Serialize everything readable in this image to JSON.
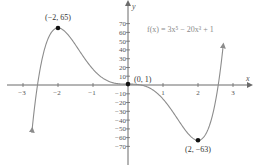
{
  "chart_data": {
    "type": "line",
    "title": "",
    "function_label": "f(x) = 3x⁵ − 20x³ + 1",
    "function_expr": "3x^5 - 20x^3 + 1",
    "xlabel": "x",
    "ylabel": "y",
    "xlim": [
      -3.5,
      3.5
    ],
    "ylim": [
      -80,
      80
    ],
    "x_ticks": [
      -3,
      -2,
      -1,
      1,
      2,
      3
    ],
    "x_tick_labels": [
      "−3",
      "−2",
      "−1",
      "1",
      "2",
      "3"
    ],
    "y_ticks": [
      70,
      60,
      50,
      40,
      30,
      20,
      10,
      -10,
      -20,
      -30,
      -40,
      -50,
      -60,
      -70
    ],
    "y_tick_labels": [
      "70",
      "60",
      "50",
      "40",
      "30",
      "20",
      "10",
      "−10",
      "−20",
      "−30",
      "−40",
      "−50",
      "−60",
      "−70"
    ],
    "grid": false,
    "legend": "none",
    "series": [
      {
        "name": "f(x) = 3x^5 - 20x^3 + 1",
        "x": [
          -2.75,
          -2.5,
          -2.25,
          -2.0,
          -1.75,
          -1.5,
          -1.25,
          -1.0,
          -0.75,
          -0.5,
          -0.25,
          0.0,
          0.25,
          0.5,
          0.75,
          1.0,
          1.25,
          1.5,
          1.75,
          2.0,
          2.25,
          2.5,
          2.75
        ],
        "y": [
          -79.8,
          19.6,
          56.0,
          65.0,
          57.1,
          45.7,
          30.7,
          18.0,
          8.2,
          2.4,
          0.3,
          1.0,
          0.7,
          -0.4,
          -6.2,
          -16.0,
          -28.7,
          -43.7,
          -56.1,
          -63.0,
          -54.0,
          -17.4,
          46.9
        ]
      }
    ],
    "annotations": [
      {
        "label": "(−2, 65)",
        "x": -2,
        "y": 65,
        "type": "local maximum"
      },
      {
        "label": "(0, 1)",
        "x": 0,
        "y": 1,
        "type": "inflection point"
      },
      {
        "label": "(2, −63)",
        "x": 2,
        "y": -63,
        "type": "local minimum"
      }
    ]
  },
  "labels": {
    "x_axis": "x",
    "y_axis": "y",
    "formula": "f(x) = 3x⁵ − 20x³ + 1",
    "max_point": "(−2, 65)",
    "origin_point": "(0, 1)",
    "min_point": "(2, −63)",
    "x_ticks": [
      "−3",
      "−2",
      "−1",
      "1",
      "2",
      "3"
    ],
    "y_ticks_pos": [
      "70",
      "60",
      "50",
      "40",
      "30",
      "20",
      "10"
    ],
    "y_ticks_neg": [
      "−10",
      "−20",
      "−30",
      "−40",
      "−50",
      "−60",
      "−70"
    ]
  },
  "colors": {
    "curve": "#8c8c8c",
    "axis": "#6b6b6b",
    "point": "#111111",
    "formula": "#8a8a8a"
  }
}
